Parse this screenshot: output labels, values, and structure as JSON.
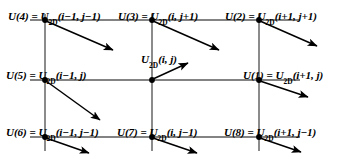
{
  "figure": {
    "type": "2d-finite-difference-stencil-diagram",
    "width": 352,
    "height": 167,
    "background_color": "#ffffff",
    "line_color": "#555555",
    "node_color": "#000000",
    "arrow_color": "#000000"
  },
  "geometry": {
    "columns_x": [
      45,
      152,
      259
    ],
    "rows_y": [
      20,
      80,
      137
    ],
    "hline_start_x": 30,
    "hline_end_x": 300,
    "vline_start_y": 14,
    "vline_end_y": 151
  },
  "nodes": [
    {
      "id": "u4",
      "local": "U(4)",
      "equals": "=",
      "global_base": "U",
      "global_sub": "2D",
      "global_args": "(i−1, j−1)",
      "full": "U(4) = U2D(i−1, j−1)",
      "col": 0,
      "row": 0,
      "x": 45,
      "y": 20,
      "arrow": {
        "dx": 71,
        "dy": 31,
        "direction": "down-right"
      }
    },
    {
      "id": "u3",
      "local": "U(3)",
      "equals": "=",
      "global_base": "U",
      "global_sub": "2D",
      "global_args": "(i, j+1)",
      "full": "U(3) = U2D(i, j+1)",
      "col": 1,
      "row": 0,
      "x": 152,
      "y": 20,
      "arrow": {
        "dx": 71,
        "dy": 31,
        "direction": "down-right"
      }
    },
    {
      "id": "u2",
      "local": "U(2)",
      "equals": "=",
      "global_base": "U",
      "global_sub": "2D",
      "global_args": "(i+1, j+1)",
      "full": "U(2) = U2D(i+1, j+1)",
      "col": 2,
      "row": 0,
      "x": 259,
      "y": 20,
      "arrow": {
        "dx": 62,
        "dy": 27,
        "direction": "down-right"
      }
    },
    {
      "id": "u5",
      "local": "U(5)",
      "equals": "=",
      "global_base": "U",
      "global_sub": "2D",
      "global_args": "(i−1, j)",
      "full": "U(5) = U2D(i−1, j)",
      "col": 0,
      "row": 1,
      "x": 45,
      "y": 80,
      "arrow": {
        "dx": 58,
        "dy": 42,
        "direction": "down-right"
      }
    },
    {
      "id": "uc",
      "local": "",
      "equals": "",
      "global_base": "U",
      "global_sub": "2D",
      "global_args": "(i, j)",
      "full": "U2D(i, j)",
      "col": 1,
      "row": 1,
      "x": 152,
      "y": 80,
      "arrow": {
        "dx": 38,
        "dy": -17,
        "direction": "up-right"
      }
    },
    {
      "id": "u1",
      "local": "U(1)",
      "equals": "=",
      "global_base": "U",
      "global_sub": "2D",
      "global_args": "(i+1, j)",
      "full": "U(1) = U2D(i+1, j)",
      "col": 2,
      "row": 1,
      "x": 259,
      "y": 80,
      "arrow": {
        "dx": 52,
        "dy": 18,
        "direction": "down-right"
      }
    },
    {
      "id": "u6",
      "local": "U(6)",
      "equals": "=",
      "global_base": "U",
      "global_sub": "2D",
      "global_args": "(i−1, j−1)",
      "full": "U(6) = U2D(i−1, j−1)",
      "col": 0,
      "row": 2,
      "x": 45,
      "y": 137,
      "arrow": {
        "dx": 47,
        "dy": 17,
        "direction": "down-right"
      }
    },
    {
      "id": "u7",
      "local": "U(7)",
      "equals": "=",
      "global_base": "U",
      "global_sub": "2D",
      "global_args": "(i, j−1)",
      "full": "U(7) = U2D(i, j−1)",
      "col": 1,
      "row": 2,
      "x": 152,
      "y": 137,
      "arrow": {
        "dx": 48,
        "dy": 17,
        "direction": "down-right"
      }
    },
    {
      "id": "u8",
      "local": "U(8)",
      "equals": "=",
      "global_base": "U",
      "global_sub": "2D",
      "global_args": "(i+1, j−1)",
      "full": "U(8) = U2D(i+1, j−1)",
      "col": 2,
      "row": 2,
      "x": 259,
      "y": 137,
      "arrow": {
        "dx": 44,
        "dy": 15,
        "direction": "down-right"
      }
    }
  ]
}
